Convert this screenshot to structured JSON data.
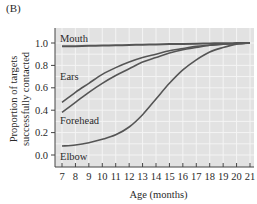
{
  "panel_label": "(B)",
  "colors": {
    "plot_background": "#e2e2e2",
    "grid": "#f4f4f4",
    "curve": "#555555",
    "axis": "#444444"
  },
  "chart_data": {
    "type": "line",
    "title": "",
    "xlabel": "Age (months)",
    "ylabel": "Proportion of targets successfully contacted",
    "ylabel_lines": [
      "Proportion of targets",
      "successfully contacted"
    ],
    "xlim": [
      7,
      21
    ],
    "ylim": [
      0.0,
      1.0
    ],
    "x_ticks": [
      7,
      8,
      9,
      10,
      11,
      12,
      13,
      14,
      15,
      16,
      17,
      18,
      19,
      20,
      21
    ],
    "y_ticks": [
      "0.0",
      "0.2",
      "0.4",
      "0.6",
      "0.8",
      "1.0"
    ],
    "grid": true,
    "legend": "inline labels",
    "x": [
      7,
      8,
      9,
      10,
      11,
      12,
      13,
      14,
      15,
      16,
      17,
      18,
      19,
      20,
      21
    ],
    "series": [
      {
        "name": "Mouth",
        "values": [
          0.97,
          0.972,
          0.975,
          0.977,
          0.98,
          0.982,
          0.985,
          0.987,
          0.99,
          0.992,
          0.994,
          0.996,
          0.998,
          0.999,
          1.0
        ]
      },
      {
        "name": "Ears",
        "values": [
          0.47,
          0.56,
          0.64,
          0.72,
          0.78,
          0.83,
          0.87,
          0.9,
          0.93,
          0.95,
          0.97,
          0.98,
          0.99,
          0.995,
          1.0
        ]
      },
      {
        "name": "Forehead",
        "values": [
          0.38,
          0.47,
          0.56,
          0.64,
          0.71,
          0.77,
          0.83,
          0.87,
          0.91,
          0.94,
          0.96,
          0.98,
          0.99,
          0.995,
          1.0
        ]
      },
      {
        "name": "Elbow",
        "values": [
          0.08,
          0.09,
          0.11,
          0.14,
          0.18,
          0.25,
          0.36,
          0.5,
          0.64,
          0.76,
          0.85,
          0.92,
          0.96,
          0.99,
          1.0
        ]
      }
    ]
  }
}
